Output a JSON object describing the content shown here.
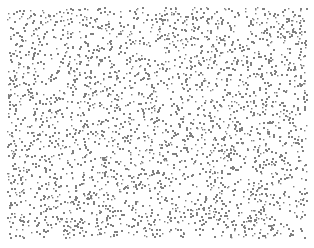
{
  "figure": {
    "width": 314,
    "height": 248,
    "background_color": "#ffffff",
    "title": "",
    "has_axes": false,
    "has_frame": false,
    "has_text": false
  },
  "chart_data": {
    "type": "scatter",
    "title": "",
    "subtitle": "",
    "xlabel": "",
    "ylabel": "",
    "grid": false,
    "legend": false,
    "legend_position": "none",
    "axis_visible": false,
    "tick_labels_x": [],
    "tick_labels_y": [],
    "xlim": [
      0,
      314
    ],
    "ylim": [
      0,
      248
    ],
    "annotations": [],
    "series": [
      {
        "name": "random-points",
        "marker": "square",
        "marker_size_px": 2,
        "color": "#808080",
        "opacity": 1,
        "point_count": 2900,
        "distribution": "uniform-random",
        "x_range": [
          7,
          306
        ],
        "y_range": [
          7,
          237
        ],
        "seed": 20240817,
        "description": "Uniform random scatter of small gray square markers filling a rectangular region with a white margin on all sides."
      }
    ]
  }
}
